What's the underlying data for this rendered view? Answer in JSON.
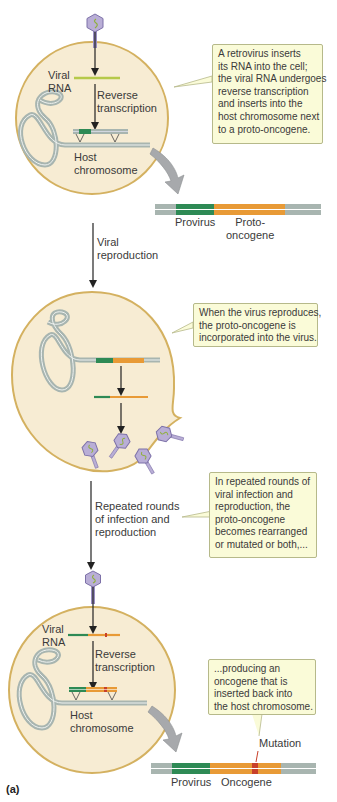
{
  "figure": {
    "panel_label": "(a)",
    "colors": {
      "cell_fill": "#f7ecd3",
      "cell_border": "#d4b160",
      "callout_fill": "#fafbd8",
      "callout_border": "#b6b98a",
      "dna_gray": "#a8b5b0",
      "provirus_green": "#2e8a55",
      "oncogene_orange": "#e89a36",
      "mutation_red": "#c8402a",
      "viral_rna_lime": "#b6c94a",
      "virus_purple": "#b9aed6"
    },
    "step1": {
      "viral_rna_label": [
        "Viral",
        "RNA"
      ],
      "reverse_transcription_label": [
        "Reverse",
        "transcription"
      ],
      "host_chromosome_label": [
        "Host",
        "chromosome"
      ],
      "callout": [
        "A retrovirus inserts",
        "its RNA into the cell;",
        "the viral RNA undergoes",
        "reverse transcription",
        "and inserts into the",
        "host chromosome next",
        "to a proto-oncogene."
      ],
      "strip_labels": {
        "provirus": "Provirus",
        "proto_oncogene": [
          "Proto-",
          "oncogene"
        ]
      }
    },
    "arrow1_label": [
      "Viral",
      "reproduction"
    ],
    "step2": {
      "callout": [
        "When the virus reproduces,",
        "the proto-oncogene is",
        "incorporated into the virus."
      ]
    },
    "arrow2_label": [
      "Repeated rounds",
      "of infection and",
      "reproduction"
    ],
    "step2b_callout": [
      "In repeated rounds of",
      "viral infection and",
      "reproduction, the",
      "proto-oncogene",
      "becomes rearranged",
      "or mutated or both,..."
    ],
    "step3": {
      "viral_rna_label": [
        "Viral",
        "RNA"
      ],
      "reverse_transcription_label": [
        "Reverse",
        "transcription"
      ],
      "host_chromosome_label": [
        "Host",
        "chromosome"
      ],
      "callout": [
        "...producing an",
        "oncogene that is",
        "inserted back into",
        "the host chromosome."
      ],
      "mutation_label": "Mutation",
      "strip_labels": {
        "provirus": "Provirus",
        "oncogene": "Oncogene"
      }
    }
  }
}
